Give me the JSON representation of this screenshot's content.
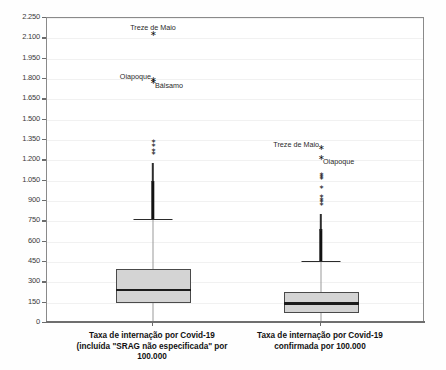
{
  "chart_data": {
    "type": "box",
    "title": "",
    "xlabel": "",
    "ylabel": "",
    "ylim": [
      0,
      2250
    ],
    "grid": true,
    "legend": "none",
    "y_ticks": [
      "0",
      "150",
      "300",
      "450",
      "600",
      "750",
      "900",
      "1.050",
      "1.200",
      "1.350",
      "1.500",
      "1.650",
      "1.800",
      "1.950",
      "2.100",
      "2.250"
    ],
    "y_tick_values": [
      0,
      150,
      300,
      450,
      600,
      750,
      900,
      1050,
      1200,
      1350,
      1500,
      1650,
      1800,
      1950,
      2100,
      2250
    ],
    "categories": [
      "Taxa de internação por Covid-19 (incluída \"SRAG não especificada\" por 100.000",
      "Taxa de internação por Covid-19 confirmada por 100.000"
    ],
    "boxes": [
      {
        "name": "Taxa de internação por Covid-19 (incluída \"SRAG não especificada\" por 100.000",
        "label_lines": [
          "Taxa de internação por Covid-19",
          "(incluída \"SRAG não especificada\" por",
          "100.000"
        ],
        "lower_whisker": 10,
        "q1": 145,
        "median": 245,
        "q3": 400,
        "upper_whisker": 765,
        "outlier_dense_top": 1250,
        "outliers_labeled": [
          {
            "label": "Treze de Maio",
            "value": 2130,
            "marker": "star",
            "label_position": "above"
          },
          {
            "label": "Oiapoque",
            "value": 1790,
            "marker": "star",
            "label_position": "left"
          },
          {
            "label": "Bálsamo",
            "value": 1775,
            "marker": "star",
            "label_position": "right"
          }
        ],
        "outliers_extra": [
          1345,
          1315,
          1275,
          1255
        ]
      },
      {
        "name": "Taxa de internação por Covid-19 confirmada por 100.000",
        "label_lines": [
          "Taxa de internação por Covid-19",
          "confirmada por 100.000"
        ],
        "lower_whisker": 5,
        "q1": 75,
        "median": 143,
        "q3": 230,
        "upper_whisker": 455,
        "outlier_dense_top": 860,
        "outliers_labeled": [
          {
            "label": "Treze de Maio",
            "value": 1290,
            "marker": "star",
            "label_position": "left"
          },
          {
            "label": "Oiapoque",
            "value": 1215,
            "marker": "star",
            "label_position": "right"
          }
        ],
        "outliers_extra": [
          1100,
          1085,
          1070,
          1000,
          935,
          915,
          900,
          880
        ]
      }
    ]
  },
  "colors": {
    "box_fill": "#d4d4d4",
    "box_border": "#4a4a4a",
    "median": "#1b1b1b",
    "whisker": "#9a9a9a",
    "outlier": "#121212",
    "frame": "#8a8a8a",
    "grid": "#f1f1f1",
    "background": "#ffffff"
  }
}
